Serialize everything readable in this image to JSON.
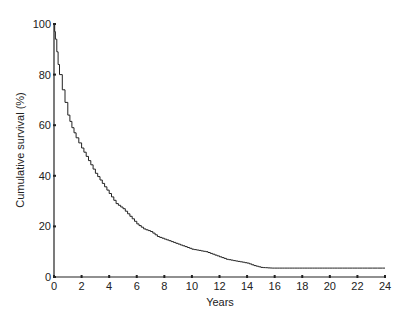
{
  "chart_data": {
    "type": "line",
    "step": true,
    "title": "",
    "xlabel": "Years",
    "ylabel": "Cumulative survival (%)",
    "xlim": [
      0,
      24
    ],
    "ylim": [
      0,
      100
    ],
    "grid": false,
    "legend": null,
    "xticks": [
      0,
      2,
      4,
      6,
      8,
      10,
      12,
      14,
      16,
      18,
      20,
      22,
      24
    ],
    "yticks": [
      0,
      20,
      40,
      60,
      80,
      100
    ],
    "series": [
      {
        "name": "Cumulative survival",
        "x": [
          0,
          0.05,
          0.1,
          0.2,
          0.3,
          0.4,
          0.6,
          0.8,
          1.0,
          1.3,
          1.6,
          2.0,
          2.5,
          3.0,
          3.5,
          4.0,
          4.5,
          5.0,
          5.5,
          6.0,
          6.5,
          7.0,
          7.5,
          8.0,
          8.5,
          9.0,
          9.5,
          10.0,
          10.5,
          11.0,
          11.5,
          12.0,
          12.5,
          13.0,
          13.5,
          14.0,
          14.5,
          15.0,
          15.5,
          16.0,
          18.0,
          20.0,
          22.0,
          24.0
        ],
        "y": [
          100,
          97,
          94,
          89,
          84,
          80,
          74,
          69,
          64,
          59,
          55,
          51,
          46,
          41,
          37,
          33,
          29,
          27,
          24,
          21,
          19,
          18,
          16,
          15,
          14,
          13,
          12,
          11,
          10.5,
          10,
          9,
          8,
          7,
          6.5,
          6,
          5.5,
          4.5,
          3.8,
          3.6,
          3.5,
          3.5,
          3.5,
          3.5,
          3.5
        ]
      }
    ]
  },
  "labels": {
    "xlabel": "Years",
    "ylabel": "Cumulative survival (%)"
  }
}
